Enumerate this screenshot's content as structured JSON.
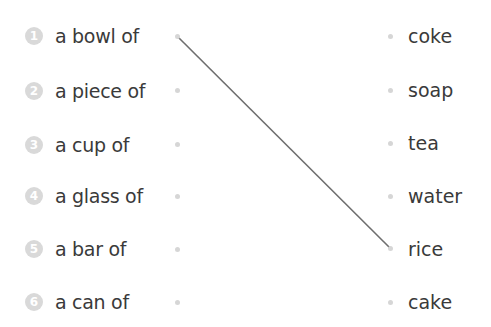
{
  "left_items": [
    {
      "number": "1",
      "label": "a bowl of"
    },
    {
      "number": "2",
      "label": "a piece of"
    },
    {
      "number": "3",
      "label": "a cup of"
    },
    {
      "number": "4",
      "label": "a glass of"
    },
    {
      "number": "5",
      "label": "a bar of"
    },
    {
      "number": "6",
      "label": "a can of"
    }
  ],
  "right_items": [
    {
      "label": "coke"
    },
    {
      "label": "soap"
    },
    {
      "label": "tea"
    },
    {
      "label": "water"
    },
    {
      "label": "rice"
    },
    {
      "label": "cake"
    }
  ],
  "connections": [
    {
      "from": "a bowl of",
      "to": "rice"
    }
  ],
  "colors": {
    "line": "#6e6e6e",
    "dot": "#d6d6d6",
    "number_badge": "#d9d9d9",
    "text": "#3a3a3a"
  }
}
